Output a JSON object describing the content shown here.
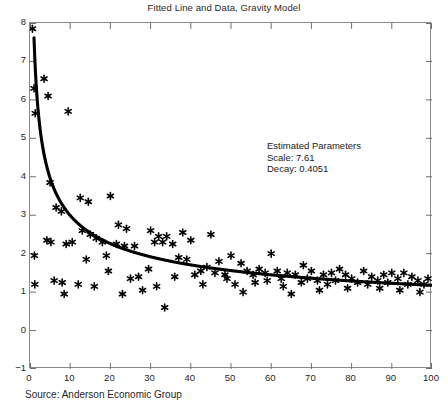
{
  "chart_data": {
    "type": "scatter",
    "title": "Fitted Line and Data, Gravity Model",
    "xlabel": "",
    "ylabel": "",
    "xlim": [
      0,
      100
    ],
    "ylim": [
      -1,
      8
    ],
    "xticks": [
      0,
      10,
      20,
      30,
      40,
      50,
      60,
      70,
      80,
      90,
      100
    ],
    "yticks": [
      -1,
      0,
      1,
      2,
      3,
      4,
      5,
      6,
      7,
      8
    ],
    "grid": false,
    "legend": "none",
    "marker": "asterisk",
    "marker_color": "#000000",
    "line_color": "#000000",
    "fit": {
      "model": "power-law decay: y = Scale * x^(-Decay)",
      "scale": 7.61,
      "decay": 0.4051
    },
    "annotations": [
      "Estimated Parameters",
      "Scale: 7.61",
      "Decay: 0.4051"
    ],
    "source": "Source: Anderson Economic Group",
    "points": [
      [
        0.6,
        7.85
      ],
      [
        1.0,
        6.3
      ],
      [
        1.3,
        5.65
      ],
      [
        1.1,
        1.95
      ],
      [
        1.2,
        1.2
      ],
      [
        3.5,
        6.55
      ],
      [
        4.5,
        6.1
      ],
      [
        9.5,
        5.7
      ],
      [
        5.0,
        3.85
      ],
      [
        6.5,
        3.2
      ],
      [
        7.8,
        3.1
      ],
      [
        4.2,
        2.35
      ],
      [
        5.2,
        2.3
      ],
      [
        9.0,
        2.25
      ],
      [
        10.5,
        2.3
      ],
      [
        6.0,
        1.3
      ],
      [
        8.0,
        1.25
      ],
      [
        8.5,
        0.95
      ],
      [
        12.5,
        3.45
      ],
      [
        14.5,
        3.35
      ],
      [
        13.0,
        2.6
      ],
      [
        15.0,
        2.5
      ],
      [
        16.5,
        2.4
      ],
      [
        18.0,
        2.3
      ],
      [
        14.0,
        1.85
      ],
      [
        19.0,
        1.95
      ],
      [
        12.0,
        1.2
      ],
      [
        16.0,
        1.15
      ],
      [
        20.0,
        3.5
      ],
      [
        22.0,
        2.75
      ],
      [
        24.0,
        2.65
      ],
      [
        21.5,
        2.25
      ],
      [
        23.5,
        2.2
      ],
      [
        26.0,
        2.2
      ],
      [
        19.5,
        1.55
      ],
      [
        25.0,
        1.35
      ],
      [
        27.0,
        1.4
      ],
      [
        23.0,
        0.95
      ],
      [
        28.0,
        1.05
      ],
      [
        30.0,
        2.6
      ],
      [
        32.0,
        2.45
      ],
      [
        34.0,
        2.45
      ],
      [
        31.0,
        2.3
      ],
      [
        33.0,
        2.3
      ],
      [
        35.5,
        2.25
      ],
      [
        29.5,
        1.6
      ],
      [
        31.5,
        1.15
      ],
      [
        33.5,
        0.6
      ],
      [
        36.0,
        1.4
      ],
      [
        38.0,
        2.55
      ],
      [
        40.0,
        2.35
      ],
      [
        37.0,
        1.9
      ],
      [
        39.0,
        1.85
      ],
      [
        41.0,
        1.45
      ],
      [
        42.5,
        1.55
      ],
      [
        44.0,
        1.65
      ],
      [
        43.0,
        1.2
      ],
      [
        45.0,
        2.5
      ],
      [
        47.0,
        1.8
      ],
      [
        46.0,
        1.5
      ],
      [
        48.5,
        1.45
      ],
      [
        50.0,
        1.95
      ],
      [
        49.0,
        1.35
      ],
      [
        51.0,
        1.2
      ],
      [
        52.5,
        1.75
      ],
      [
        54.0,
        1.55
      ],
      [
        53.0,
        1.0
      ],
      [
        55.5,
        1.45
      ],
      [
        57.0,
        1.6
      ],
      [
        58.5,
        1.5
      ],
      [
        56.0,
        1.25
      ],
      [
        60.0,
        2.0
      ],
      [
        61.5,
        1.55
      ],
      [
        59.0,
        1.3
      ],
      [
        62.5,
        1.35
      ],
      [
        64.0,
        1.5
      ],
      [
        66.0,
        1.45
      ],
      [
        63.0,
        1.15
      ],
      [
        65.0,
        0.95
      ],
      [
        68.0,
        1.7
      ],
      [
        70.0,
        1.55
      ],
      [
        69.0,
        1.35
      ],
      [
        67.5,
        1.25
      ],
      [
        71.5,
        1.3
      ],
      [
        73.0,
        1.45
      ],
      [
        75.0,
        1.5
      ],
      [
        74.0,
        1.2
      ],
      [
        72.0,
        1.05
      ],
      [
        77.0,
        1.6
      ],
      [
        78.5,
        1.45
      ],
      [
        76.0,
        1.3
      ],
      [
        80.0,
        1.35
      ],
      [
        81.5,
        1.25
      ],
      [
        79.0,
        1.1
      ],
      [
        83.0,
        1.55
      ],
      [
        85.0,
        1.4
      ],
      [
        84.0,
        1.2
      ],
      [
        86.5,
        1.3
      ],
      [
        88.0,
        1.45
      ],
      [
        90.0,
        1.5
      ],
      [
        89.0,
        1.25
      ],
      [
        87.0,
        1.1
      ],
      [
        91.5,
        1.35
      ],
      [
        93.0,
        1.5
      ],
      [
        95.0,
        1.4
      ],
      [
        94.0,
        1.2
      ],
      [
        92.0,
        1.05
      ],
      [
        96.5,
        1.3
      ],
      [
        98.0,
        1.2
      ],
      [
        99.0,
        1.35
      ],
      [
        97.0,
        1.0
      ]
    ]
  }
}
